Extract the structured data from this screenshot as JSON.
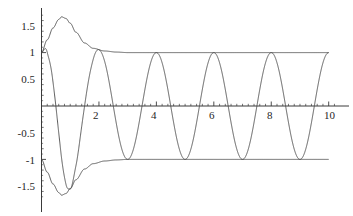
{
  "chart_data": {
    "type": "line",
    "title": "",
    "subtitle": "",
    "xlabel": "",
    "ylabel": "",
    "xlim": [
      0,
      10.25
    ],
    "ylim": [
      -1.75,
      1.75
    ],
    "grid": false,
    "legend": null,
    "x_ticks": [
      2,
      4,
      6,
      8,
      10
    ],
    "x_tick_labels": [
      "2",
      "4",
      "6",
      "8",
      "10"
    ],
    "y_ticks": [
      1.5,
      1,
      0.5,
      -0.5,
      -1,
      -1.5
    ],
    "y_tick_labels": [
      "1.5",
      "1",
      "0.5",
      "-0.5",
      "-1",
      "-1.5"
    ],
    "x_minor_ticks_per_interval": 5,
    "y_minor_ticks_per_interval": 5,
    "axis_color": "#3a3a3a",
    "curve_color": "#4a4a4a",
    "background": "#ffffff",
    "series": [
      {
        "name": "oscillation",
        "description": "oscillating curve, period 2, peaks at odd x, troughs at even x, amplitude modulated by envelope",
        "period": 2,
        "peaks_at_x": [
          1,
          3,
          5,
          7,
          9
        ],
        "troughs_at_x": [
          2,
          4,
          6,
          8,
          10
        ],
        "x": [
          0,
          0.25,
          0.5,
          0.7,
          1,
          1.5,
          2,
          2.5,
          3,
          3.5,
          4,
          4.5,
          5,
          5.5,
          6,
          6.5,
          7,
          7.5,
          8,
          8.5,
          9,
          9.5,
          10
        ],
        "values": [
          1,
          0.79,
          -0.04,
          -1.05,
          -1.63,
          0,
          1.46,
          0,
          -1.15,
          0,
          1.05,
          0,
          -1.02,
          0,
          1.01,
          0,
          -1,
          0,
          1,
          0,
          -1,
          0,
          1
        ]
      },
      {
        "name": "upper-envelope",
        "description": "upper envelope: starts at 1, rises to about 1.67 near x=0.7, decays back to 1",
        "x": [
          0,
          0.2,
          0.4,
          0.6,
          0.7,
          0.85,
          1,
          1.2,
          1.5,
          1.8,
          2.2,
          2.6,
          3,
          4,
          5,
          6,
          7,
          8,
          9,
          10
        ],
        "values": [
          1.0,
          1.24,
          1.46,
          1.62,
          1.67,
          1.64,
          1.55,
          1.38,
          1.18,
          1.08,
          1.03,
          1.01,
          1.0,
          1.0,
          1.0,
          1.0,
          1.0,
          1.0,
          1.0,
          1.0
        ]
      },
      {
        "name": "lower-envelope",
        "description": "lower envelope: mirror of upper envelope, starts at -1, dips to about -1.67 near x=0.7, returns to -1",
        "x": [
          0,
          0.2,
          0.4,
          0.6,
          0.7,
          0.85,
          1,
          1.2,
          1.5,
          1.8,
          2.2,
          2.6,
          3,
          4,
          5,
          6,
          7,
          8,
          9,
          10
        ],
        "values": [
          -1.0,
          -1.24,
          -1.46,
          -1.62,
          -1.67,
          -1.64,
          -1.55,
          -1.38,
          -1.18,
          -1.08,
          -1.03,
          -1.01,
          -1.0,
          -1.0,
          -1.0,
          -1.0,
          -1.0,
          -1.0,
          -1.0,
          -1.0
        ]
      }
    ],
    "annotations": []
  },
  "axes": {
    "x_axis_name": "horizontal-axis",
    "y_axis_name": "vertical-axis"
  }
}
